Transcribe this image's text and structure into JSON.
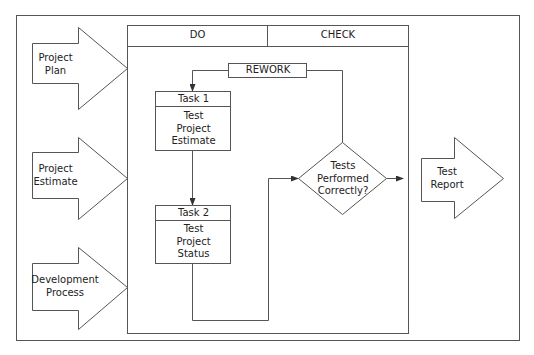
{
  "headers": {
    "do": "DO",
    "check": "CHECK"
  },
  "inputs": [
    {
      "label": "Project\nPlan"
    },
    {
      "label": "Project\nEstimate"
    },
    {
      "label": "Development\nProcess"
    }
  ],
  "rework": {
    "label": "REWORK"
  },
  "tasks": [
    {
      "title": "Task 1",
      "body": "Test\nProject\nEstimate"
    },
    {
      "title": "Task 2",
      "body": "Test\nProject\nStatus"
    }
  ],
  "decision": {
    "label": "Tests\nPerformed\nCorrectly?"
  },
  "output": {
    "label": "Test\nReport"
  },
  "colors": {
    "stroke": "#555555",
    "text": "#222222",
    "background": "#ffffff"
  }
}
